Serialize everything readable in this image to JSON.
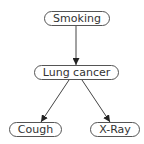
{
  "diagram": {
    "type": "bayesian-network",
    "colors": {
      "edge": "#444444",
      "node_border": "#555555",
      "text": "#333333",
      "background": "#ffffff"
    },
    "nodes": [
      {
        "id": "smoking",
        "label": "Smoking",
        "x": 44,
        "y": 11,
        "w": 66,
        "h": 15
      },
      {
        "id": "lung_cancer",
        "label": "Lung cancer",
        "x": 34,
        "y": 65,
        "w": 85,
        "h": 15
      },
      {
        "id": "cough",
        "label": "Cough",
        "x": 9,
        "y": 122,
        "w": 53,
        "h": 15
      },
      {
        "id": "xray",
        "label": "X-Ray",
        "x": 90,
        "y": 122,
        "w": 50,
        "h": 15
      }
    ],
    "edges": [
      {
        "from": "smoking",
        "to": "lung_cancer",
        "x1": 76,
        "y1": 26,
        "x2": 76,
        "y2": 65
      },
      {
        "from": "lung_cancer",
        "to": "cough",
        "x1": 69,
        "y1": 80,
        "x2": 41,
        "y2": 122
      },
      {
        "from": "lung_cancer",
        "to": "xray",
        "x1": 82,
        "y1": 80,
        "x2": 110,
        "y2": 122
      }
    ]
  }
}
